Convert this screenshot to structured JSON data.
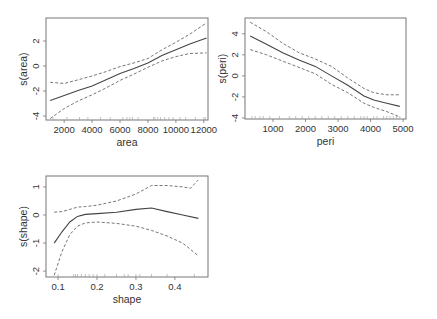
{
  "chart_data": [
    {
      "type": "line",
      "title": "",
      "xlabel": "area",
      "ylabel": "s(area)",
      "xlim": [
        700,
        12300
      ],
      "ylim": [
        -4.32,
        3.84
      ],
      "xticks": [
        2000,
        4000,
        6000,
        8000,
        10000,
        12000
      ],
      "xtick_labels": [
        "2000",
        "4000",
        "6000",
        "8000",
        "10000",
        "12000"
      ],
      "yticks": [
        -4,
        -2,
        0,
        2
      ],
      "ytick_labels": [
        "-4",
        "-2",
        "0",
        "2"
      ],
      "grid": false,
      "series": [
        {
          "name": "fit",
          "style": "solid",
          "x": [
            1000,
            2000,
            3000,
            4000,
            5000,
            6000,
            7000,
            8000,
            9000,
            10000,
            11000,
            12200
          ],
          "y": [
            -2.75,
            -2.35,
            -1.95,
            -1.6,
            -1.1,
            -0.6,
            -0.2,
            0.25,
            0.85,
            1.3,
            1.75,
            2.25
          ]
        },
        {
          "name": "upper",
          "style": "dashed",
          "x": [
            1000,
            2000,
            3000,
            4000,
            5000,
            6000,
            7000,
            8000,
            9000,
            10000,
            11000,
            12200
          ],
          "y": [
            -1.3,
            -1.4,
            -1.1,
            -0.8,
            -0.45,
            -0.05,
            0.25,
            0.6,
            1.3,
            1.9,
            2.55,
            3.45
          ]
        },
        {
          "name": "lower",
          "style": "dashed",
          "x": [
            1000,
            2000,
            3000,
            4000,
            5000,
            6000,
            7000,
            8000,
            9000,
            10000,
            11000,
            12200
          ],
          "y": [
            -4.2,
            -3.4,
            -2.8,
            -2.3,
            -1.75,
            -1.15,
            -0.65,
            -0.1,
            0.4,
            0.75,
            1.0,
            1.05
          ]
        }
      ],
      "rug": [
        1200,
        2200,
        3100,
        3700,
        4600,
        5300,
        6200,
        6500,
        6700,
        6900,
        7300,
        8400,
        8500,
        8700,
        8900,
        9200,
        9500,
        9800,
        10300,
        10700,
        11400,
        12000,
        12100
      ]
    },
    {
      "type": "line",
      "title": "",
      "xlabel": "peri",
      "ylabel": "s(peri)",
      "xlim": [
        140,
        5090
      ],
      "ylim": [
        -4.1,
        5.5
      ],
      "xticks": [
        1000,
        2000,
        3000,
        4000,
        5000
      ],
      "xtick_labels": [
        "1000",
        "2000",
        "3000",
        "4000",
        "5000"
      ],
      "yticks": [
        -4,
        -2,
        0,
        2,
        4
      ],
      "ytick_labels": [
        "-4",
        "-2",
        "0",
        "2",
        "4"
      ],
      "grid": false,
      "series": [
        {
          "name": "fit",
          "style": "solid",
          "x": [
            300,
            800,
            1300,
            1800,
            2300,
            2800,
            3300,
            3800,
            4100,
            4500,
            4900
          ],
          "y": [
            3.8,
            3.0,
            2.2,
            1.5,
            0.9,
            0.0,
            -0.9,
            -1.9,
            -2.3,
            -2.6,
            -2.9
          ]
        },
        {
          "name": "upper",
          "style": "dashed",
          "x": [
            300,
            800,
            1300,
            1800,
            2300,
            2800,
            3300,
            3800,
            4100,
            4500,
            4900
          ],
          "y": [
            5.1,
            4.2,
            3.1,
            2.2,
            1.6,
            0.9,
            -0.2,
            -1.2,
            -1.6,
            -1.8,
            -1.8
          ]
        },
        {
          "name": "lower",
          "style": "dashed",
          "x": [
            300,
            800,
            1300,
            1800,
            2300,
            2800,
            3300,
            3800,
            4100,
            4500,
            4900
          ],
          "y": [
            2.5,
            2.0,
            1.4,
            0.8,
            0.2,
            -0.8,
            -1.6,
            -2.6,
            -3.0,
            -3.4,
            -3.9
          ]
        }
      ],
      "rug": [
        350,
        450,
        600,
        700,
        900,
        1200,
        1500,
        1700,
        1900,
        2100,
        2300,
        2500,
        2700,
        2900,
        3100,
        3300,
        3500,
        3700,
        3800,
        3900,
        4100,
        4200,
        4400,
        4500,
        4600,
        4700,
        4800,
        4900
      ]
    },
    {
      "type": "line",
      "title": "",
      "xlabel": "shape",
      "ylabel": "s(shape)",
      "xlim": [
        0.069,
        0.485
      ],
      "ylim": [
        -2.21,
        1.39
      ],
      "xticks": [
        0.1,
        0.2,
        0.3,
        0.4
      ],
      "xtick_labels": [
        "0.1",
        "0.2",
        "0.3",
        "0.4"
      ],
      "yticks": [
        -2,
        -1,
        0,
        1
      ],
      "ytick_labels": [
        "-2",
        "-1",
        "0",
        "1"
      ],
      "grid": false,
      "series": [
        {
          "name": "fit",
          "style": "solid",
          "x": [
            0.09,
            0.11,
            0.13,
            0.15,
            0.17,
            0.2,
            0.25,
            0.3,
            0.34,
            0.38,
            0.42,
            0.46
          ],
          "y": [
            -1.0,
            -0.6,
            -0.25,
            -0.05,
            0.02,
            0.05,
            0.1,
            0.2,
            0.25,
            0.12,
            0.0,
            -0.12
          ]
        },
        {
          "name": "upper",
          "style": "dashed",
          "x": [
            0.09,
            0.11,
            0.13,
            0.15,
            0.17,
            0.2,
            0.25,
            0.3,
            0.34,
            0.38,
            0.42,
            0.44,
            0.46
          ],
          "y": [
            0.1,
            0.12,
            0.2,
            0.28,
            0.3,
            0.35,
            0.5,
            0.75,
            1.05,
            1.05,
            1.0,
            0.95,
            1.25
          ]
        },
        {
          "name": "lower",
          "style": "dashed",
          "x": [
            0.09,
            0.11,
            0.13,
            0.15,
            0.17,
            0.2,
            0.25,
            0.3,
            0.34,
            0.38,
            0.42,
            0.46
          ],
          "y": [
            -2.15,
            -1.3,
            -0.7,
            -0.4,
            -0.28,
            -0.25,
            -0.3,
            -0.4,
            -0.55,
            -0.75,
            -1.0,
            -1.45
          ]
        }
      ],
      "rug": [
        0.1,
        0.14,
        0.145,
        0.15,
        0.16,
        0.17,
        0.18,
        0.19,
        0.2,
        0.22,
        0.25,
        0.27,
        0.28,
        0.3,
        0.31,
        0.34,
        0.38,
        0.45
      ]
    }
  ],
  "panels": [
    {
      "xlabel": "area",
      "ylabel": "s(area)"
    },
    {
      "xlabel": "peri",
      "ylabel": "s(peri)"
    },
    {
      "xlabel": "shape",
      "ylabel": "s(shape)"
    }
  ]
}
